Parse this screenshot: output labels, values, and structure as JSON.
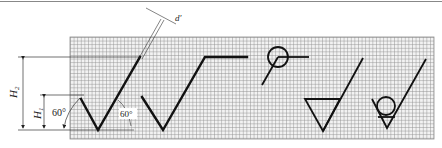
{
  "figure": {
    "grid": {
      "x": 70,
      "y": 37,
      "width": 364,
      "height": 102,
      "cell": 3.6,
      "color": "#9a9a9a",
      "background": "#e6e6e6"
    },
    "stroke_color": "#111111",
    "labels": {
      "h2": "H",
      "h2_sub": "2",
      "h1": "H",
      "h1_sub": "1",
      "angle_left": "60°",
      "angle_inner": "60°",
      "line_width": "d′"
    },
    "symbols": [
      {
        "name": "basic-surface-texture-symbol",
        "description": "short-leg V with long right leg"
      },
      {
        "name": "material-removal-extended-symbol",
        "description": "V with long leg and horizontal extension"
      },
      {
        "name": "all-around-circle-symbol",
        "description": "circle with leader and horizontal line"
      },
      {
        "name": "material-removal-triangle-symbol",
        "description": "inverted triangle with long leg"
      },
      {
        "name": "no-material-removal-circle-symbol",
        "description": "V with inscribed circle and long leg"
      }
    ]
  }
}
